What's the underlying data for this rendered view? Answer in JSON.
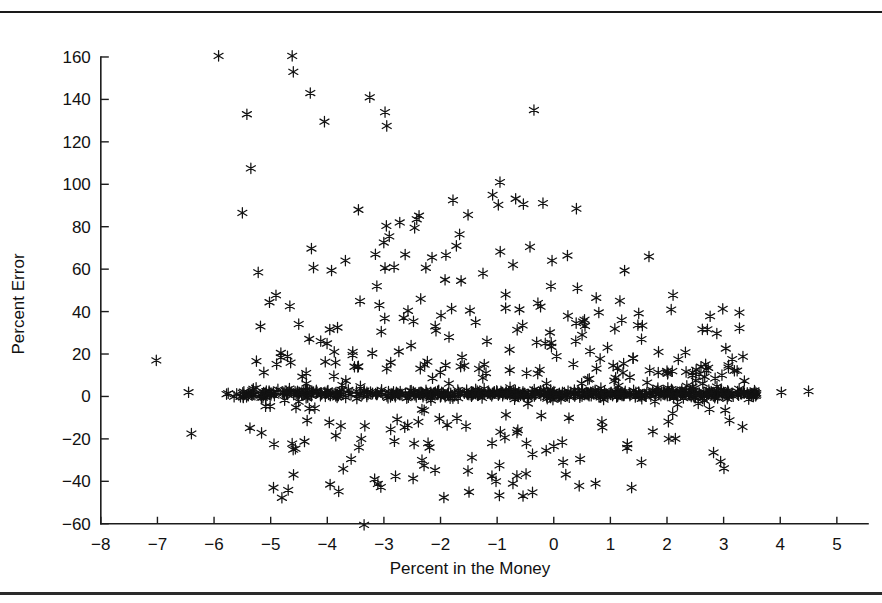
{
  "figure": {
    "background_color": "#ffffff",
    "marker_color": "#121212",
    "axis_color": "#1c1c1c",
    "top_rule": "top-divider-rule",
    "bottom_rule": "bottom-divider-rule"
  },
  "chart_data": {
    "type": "scatter",
    "title": "",
    "xlabel": "Percent in the Money",
    "ylabel": "Percent Error",
    "xlim": [
      -8.35,
      5.55
    ],
    "ylim": [
      -62,
      168
    ],
    "xticks": [
      -8,
      -7,
      -6,
      -5,
      -4,
      -3,
      -2,
      -1,
      0,
      1,
      2,
      3,
      4,
      5
    ],
    "xtick_labels": [
      "−8",
      "−7",
      "−6",
      "−5",
      "−4",
      "−3",
      "−2",
      "−1",
      "0",
      "1",
      "2",
      "3",
      "4",
      "5"
    ],
    "yticks": [
      -60,
      -40,
      -20,
      0,
      20,
      40,
      60,
      80,
      100,
      120,
      140,
      160
    ],
    "ytick_labels": [
      "−60",
      "−40",
      "−20",
      "0",
      "20",
      "40",
      "60",
      "80",
      "100",
      "120",
      "140",
      "160"
    ],
    "grid": false,
    "legend": false,
    "marker": "asterisk",
    "marker_size": 5.2,
    "series": [
      {
        "name": "Option pricing error",
        "points": [
          [
            -7.02,
            17.0
          ],
          [
            -6.45,
            2.0
          ],
          [
            -6.4,
            -17.5
          ],
          [
            -5.92,
            160.5
          ],
          [
            -5.75,
            1.5
          ],
          [
            -5.6,
            1.2
          ],
          [
            -5.5,
            86.5
          ],
          [
            -5.42,
            133.0
          ],
          [
            -5.35,
            107.5
          ],
          [
            -5.3,
            1.0
          ],
          [
            -5.22,
            58.5
          ],
          [
            -5.18,
            33.0
          ],
          [
            -5.1,
            1.5
          ],
          [
            -5.02,
            1.0
          ],
          [
            -4.95,
            -43.0
          ],
          [
            -4.9,
            2.0
          ],
          [
            -4.82,
            20.5
          ],
          [
            -4.78,
            1.2
          ],
          [
            -4.7,
            1.0
          ],
          [
            -4.62,
            160.5
          ],
          [
            -4.6,
            153.0
          ],
          [
            -4.55,
            1.5
          ],
          [
            -4.5,
            2.0
          ],
          [
            -4.45,
            1.0
          ],
          [
            -4.38,
            1.4
          ],
          [
            -4.3,
            143.0
          ],
          [
            -4.28,
            1.0
          ],
          [
            -4.22,
            -5.5
          ],
          [
            -4.18,
            2.0
          ],
          [
            -4.12,
            1.0
          ],
          [
            -4.05,
            129.5
          ],
          [
            -4.02,
            1.5
          ],
          [
            -3.98,
            1.0
          ],
          [
            -3.95,
            -41.5
          ],
          [
            -3.9,
            1.2
          ],
          [
            -3.85,
            -18.5
          ],
          [
            -3.82,
            1.0
          ],
          [
            -3.78,
            2.0
          ],
          [
            -3.72,
            1.0
          ],
          [
            -3.68,
            64.0
          ],
          [
            -3.62,
            1.5
          ],
          [
            -3.58,
            1.0
          ],
          [
            -3.55,
            21.0
          ],
          [
            -3.52,
            14.0
          ],
          [
            -3.48,
            1.0
          ],
          [
            -3.45,
            88.0
          ],
          [
            -3.42,
            1.5
          ],
          [
            -3.4,
            -20.0
          ],
          [
            -3.35,
            -60.5
          ],
          [
            -3.3,
            2.0
          ],
          [
            -3.28,
            1.0
          ],
          [
            -3.25,
            141.0
          ],
          [
            -3.2,
            1.5
          ],
          [
            -3.15,
            67.0
          ],
          [
            -3.12,
            1.0
          ],
          [
            -3.08,
            43.0
          ],
          [
            -3.05,
            2.0
          ],
          [
            -3.02,
            1.0
          ],
          [
            -2.98,
            134.0
          ],
          [
            -2.95,
            127.5
          ],
          [
            -2.92,
            1.5
          ],
          [
            -2.88,
            16.0
          ],
          [
            -2.85,
            1.0
          ],
          [
            -2.82,
            61.0
          ],
          [
            -2.78,
            2.0
          ],
          [
            -2.75,
            1.2
          ],
          [
            -2.72,
            82.0
          ],
          [
            -2.68,
            1.0
          ],
          [
            -2.65,
            37.0
          ],
          [
            -2.62,
            1.5
          ],
          [
            -2.58,
            -13.5
          ],
          [
            -2.55,
            1.0
          ],
          [
            -2.52,
            24.0
          ],
          [
            -2.48,
            2.0
          ],
          [
            -2.45,
            1.0
          ],
          [
            -2.42,
            83.5
          ],
          [
            -2.38,
            1.5
          ],
          [
            -2.35,
            46.0
          ],
          [
            -2.32,
            1.0
          ],
          [
            -2.28,
            15.0
          ],
          [
            -2.25,
            2.0
          ],
          [
            -2.22,
            -22.0
          ],
          [
            -2.18,
            1.0
          ],
          [
            -2.15,
            65.5
          ],
          [
            -2.12,
            1.5
          ],
          [
            -2.08,
            31.0
          ],
          [
            -2.05,
            1.0
          ],
          [
            -2.02,
            -10.5
          ],
          [
            -1.98,
            2.0
          ],
          [
            -1.95,
            1.2
          ],
          [
            -1.92,
            55.0
          ],
          [
            -1.88,
            1.0
          ],
          [
            -1.85,
            28.0
          ],
          [
            -1.82,
            1.5
          ],
          [
            -1.78,
            92.5
          ],
          [
            -1.75,
            1.0
          ],
          [
            -1.72,
            71.0
          ],
          [
            -1.68,
            2.0
          ],
          [
            -1.65,
            1.0
          ],
          [
            -1.62,
            18.5
          ],
          [
            -1.58,
            1.5
          ],
          [
            -1.55,
            -14.0
          ],
          [
            -1.52,
            1.0
          ],
          [
            -1.48,
            40.5
          ],
          [
            -1.45,
            2.0
          ],
          [
            -1.42,
            1.2
          ],
          [
            -1.38,
            35.0
          ],
          [
            -1.35,
            1.0
          ],
          [
            -1.32,
            13.0
          ],
          [
            -1.28,
            1.5
          ],
          [
            -1.25,
            58.0
          ],
          [
            -1.22,
            1.0
          ],
          [
            -1.18,
            26.0
          ],
          [
            -1.15,
            2.0
          ],
          [
            -1.12,
            1.0
          ],
          [
            -1.08,
            95.0
          ],
          [
            -1.05,
            1.5
          ],
          [
            -1.02,
            -40.0
          ],
          [
            -0.98,
            1.0
          ],
          [
            -0.95,
            101.0
          ],
          [
            -0.92,
            2.0
          ],
          [
            -0.88,
            1.2
          ],
          [
            -0.85,
            48.0
          ],
          [
            -0.82,
            1.0
          ],
          [
            -0.78,
            22.0
          ],
          [
            -0.75,
            1.5
          ],
          [
            -0.72,
            62.0
          ],
          [
            -0.68,
            1.0
          ],
          [
            -0.65,
            -17.0
          ],
          [
            -0.62,
            2.0
          ],
          [
            -0.58,
            1.0
          ],
          [
            -0.55,
            33.5
          ],
          [
            -0.52,
            1.5
          ],
          [
            -0.48,
            11.0
          ],
          [
            -0.45,
            1.0
          ],
          [
            -0.42,
            70.5
          ],
          [
            -0.38,
            2.0
          ],
          [
            -0.35,
            135.0
          ],
          [
            -0.32,
            1.0
          ],
          [
            -0.28,
            44.0
          ],
          [
            -0.25,
            1.5
          ],
          [
            -0.22,
            -9.0
          ],
          [
            -0.18,
            1.0
          ],
          [
            -0.15,
            25.0
          ],
          [
            -0.12,
            2.0
          ],
          [
            -0.08,
            1.2
          ],
          [
            -0.05,
            52.0
          ],
          [
            0.0,
            1.0
          ],
          [
            0.05,
            19.0
          ],
          [
            0.1,
            1.5
          ],
          [
            0.15,
            -21.5
          ],
          [
            0.2,
            1.0
          ],
          [
            0.25,
            38.0
          ],
          [
            0.3,
            2.0
          ],
          [
            0.35,
            1.0
          ],
          [
            0.4,
            88.5
          ],
          [
            0.45,
            1.5
          ],
          [
            0.5,
            29.0
          ],
          [
            0.55,
            1.0
          ],
          [
            0.6,
            8.0
          ],
          [
            0.65,
            2.0
          ],
          [
            0.7,
            1.2
          ],
          [
            0.75,
            46.5
          ],
          [
            0.8,
            1.0
          ],
          [
            0.85,
            -12.0
          ],
          [
            0.9,
            1.5
          ],
          [
            0.95,
            23.0
          ],
          [
            1.0,
            1.0
          ],
          [
            1.05,
            14.5
          ],
          [
            1.1,
            2.0
          ],
          [
            1.15,
            1.0
          ],
          [
            1.2,
            36.0
          ],
          [
            1.25,
            1.5
          ],
          [
            1.3,
            -22.5
          ],
          [
            1.35,
            1.0
          ],
          [
            1.4,
            18.0
          ],
          [
            1.45,
            2.0
          ],
          [
            1.5,
            1.2
          ],
          [
            1.55,
            27.0
          ],
          [
            1.6,
            1.0
          ],
          [
            1.65,
            6.5
          ],
          [
            1.7,
            1.5
          ],
          [
            1.75,
            -16.5
          ],
          [
            1.8,
            1.0
          ],
          [
            1.85,
            21.0
          ],
          [
            1.9,
            2.0
          ],
          [
            1.95,
            1.0
          ],
          [
            2.0,
            12.0
          ],
          [
            2.05,
            1.5
          ],
          [
            2.1,
            -8.0
          ],
          [
            2.15,
            1.0
          ],
          [
            2.2,
            17.5
          ],
          [
            2.25,
            2.0
          ],
          [
            2.3,
            1.2
          ],
          [
            2.35,
            5.0
          ],
          [
            2.4,
            1.0
          ],
          [
            2.45,
            10.0
          ],
          [
            2.5,
            1.5
          ],
          [
            2.55,
            1.0
          ],
          [
            2.6,
            14.0
          ],
          [
            2.65,
            2.0
          ],
          [
            2.7,
            1.0
          ],
          [
            2.75,
            -6.0
          ],
          [
            2.8,
            1.5
          ],
          [
            2.85,
            8.5
          ],
          [
            2.9,
            1.0
          ],
          [
            2.95,
            3.0
          ],
          [
            3.0,
            2.0
          ],
          [
            3.05,
            1.2
          ],
          [
            3.1,
            1.0
          ],
          [
            3.15,
            1.5
          ],
          [
            3.25,
            1.0
          ],
          [
            3.35,
            2.0
          ],
          [
            3.45,
            1.0
          ],
          [
            3.55,
            1.5
          ],
          [
            4.02,
            2.0
          ],
          [
            4.5,
            2.5
          ]
        ]
      }
    ],
    "dense_band": {
      "description": "dense near-zero band of overlapping markers",
      "y_center": 1.2,
      "y_jitter": 1.8,
      "x_start": -5.8,
      "x_end": 3.6,
      "count": 430
    },
    "scatter_cloud": {
      "description": "diffuse cloud above and below the band, widest near x=-1",
      "count": 260
    }
  }
}
